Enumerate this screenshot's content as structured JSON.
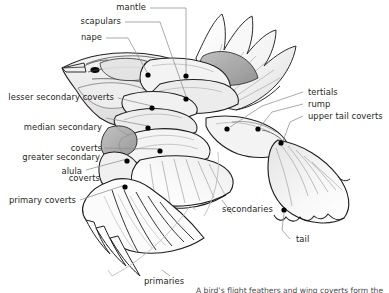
{
  "figure": {
    "line_color": "#1a1a1a",
    "leader_color": "#8d8d8d",
    "bracket_color": "#b9b9b9",
    "text_color": "#231f20",
    "marker_color": "#000000",
    "background": "#ffffff",
    "shading_light": "#f2f2f2",
    "shading_mid": "#d9d9d9",
    "shading_dark": "#9a9a9a"
  },
  "labels": {
    "mantle": "mantle",
    "scapulars": "scapulars",
    "nape": "nape",
    "lesser_secondary_coverts": "lesser secondary coverts",
    "median_secondary_coverts_1": "median secondary",
    "median_secondary_coverts_2": "coverts",
    "greater_secondary_coverts_1": "greater secondary",
    "greater_secondary_coverts_2": "coverts",
    "alula": "alula",
    "primary_coverts": "primary coverts",
    "tertials": "tertials",
    "rump": "rump",
    "upper_tail_coverts": "upper tail coverts",
    "secondaries": "secondaries",
    "tail": "tail",
    "primaries": "primaries",
    "caption_clipped": "A bird’s flight feathers and wing coverts form the"
  },
  "markers": [
    {
      "name": "eye",
      "x": 95,
      "y": 70
    },
    {
      "name": "nape-marker",
      "x": 148,
      "y": 78
    },
    {
      "name": "mantle-marker",
      "x": 186,
      "y": 78
    },
    {
      "name": "scapulars-marker",
      "x": 186,
      "y": 100
    },
    {
      "name": "lesser-secondary-coverts-marker",
      "x": 152,
      "y": 109
    },
    {
      "name": "median-secondary-coverts-marker",
      "x": 148,
      "y": 129
    },
    {
      "name": "greater-secondary-coverts-marker",
      "x": 160,
      "y": 152
    },
    {
      "name": "alula-marker",
      "x": 127,
      "y": 162
    },
    {
      "name": "primary-coverts-marker",
      "x": 125,
      "y": 188
    },
    {
      "name": "tertials-marker",
      "x": 227,
      "y": 130
    },
    {
      "name": "rump-marker",
      "x": 258,
      "y": 130
    },
    {
      "name": "upper-tail-coverts-marker",
      "x": 281,
      "y": 144
    },
    {
      "name": "tail-marker",
      "x": 284,
      "y": 210
    }
  ]
}
